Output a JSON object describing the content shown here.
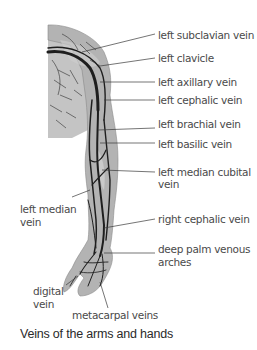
{
  "figure": {
    "caption": "Veins of the arms and hands",
    "labels": {
      "left_subclavian_vein": "left subclavian vein",
      "left_clavicle": "left clavicle",
      "left_axillary_vein": "left axillary vein",
      "left_cephalic_vein": "left cephalic vein",
      "left_brachial_vein": "left brachial vein",
      "left_basilic_vein": "left basilic vein",
      "left_median_cubital_vein_1": "left median cubital",
      "left_median_cubital_vein_2": "vein",
      "left_median_vein_1": "left median",
      "left_median_vein_2": "vein",
      "right_cephalic_vein": "right cephalic vein",
      "deep_palm_venous_arches_1": "deep palm venous",
      "deep_palm_venous_arches_2": "arches",
      "digital_vein_1": "digital",
      "digital_vein_2": "vein",
      "metacarpal_veins": "metacarpal veins"
    },
    "colors": {
      "skin": "#b8b8b8",
      "vein": "#1e1e1e",
      "leader": "#3a3a3a",
      "text": "#4a4a4a"
    }
  }
}
